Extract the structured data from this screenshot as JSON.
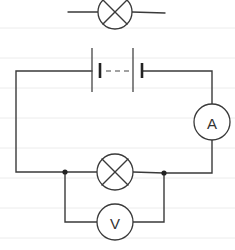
{
  "diagram": {
    "type": "circuit",
    "background": "ruled paper",
    "components": [
      {
        "id": "lamp-key",
        "kind": "lamp",
        "symbol": "circle-with-cross"
      },
      {
        "id": "battery",
        "kind": "battery",
        "cells": "multiple (dashed)"
      },
      {
        "id": "ammeter",
        "kind": "ammeter",
        "label": "A"
      },
      {
        "id": "lamp",
        "kind": "lamp",
        "symbol": "circle-with-cross"
      },
      {
        "id": "voltmeter",
        "kind": "voltmeter",
        "label": "V",
        "connection": "parallel across lamp"
      }
    ],
    "junctions": 2
  },
  "labels": {
    "ammeter": "A",
    "voltmeter": "V"
  },
  "colors": {
    "ink": "#3a3a3a",
    "paper": "#ffffff",
    "rule": "#ececec"
  }
}
